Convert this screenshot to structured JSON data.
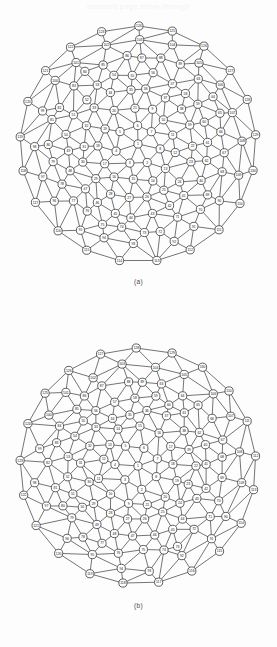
{
  "page": {
    "bleed_through_text": "scanned page show-through",
    "background_color": "#fdfdfd",
    "ink_color": "#2a2a2a"
  },
  "figures": [
    {
      "id": "fig-a",
      "caption": "(a)",
      "type": "planar-triangulation-disk",
      "node_count": 130,
      "description": "Triangulated disk graph with numbered circular vertices",
      "node_labels": [
        "1",
        "2",
        "3",
        "4",
        "5",
        "6",
        "7",
        "8",
        "9",
        "10",
        "11",
        "12",
        "13",
        "14",
        "15",
        "16",
        "17",
        "18",
        "19",
        "20",
        "21",
        "22",
        "23",
        "24",
        "25",
        "26",
        "27",
        "28",
        "29",
        "30",
        "31",
        "32",
        "33",
        "34",
        "35",
        "36",
        "37",
        "38",
        "39",
        "40",
        "41",
        "42",
        "43",
        "44",
        "45",
        "46",
        "47",
        "48",
        "49",
        "50",
        "51",
        "52",
        "53",
        "54",
        "55",
        "56",
        "57",
        "58",
        "59",
        "60",
        "61",
        "62",
        "63",
        "64",
        "65",
        "66",
        "67",
        "68",
        "69",
        "70",
        "71",
        "72",
        "73",
        "74",
        "75",
        "76",
        "77",
        "78",
        "79",
        "80",
        "81",
        "82",
        "83",
        "84",
        "85",
        "86",
        "87",
        "88",
        "89",
        "90",
        "91",
        "92",
        "93",
        "94",
        "95",
        "96",
        "97",
        "98",
        "99",
        "100",
        "101",
        "102",
        "103",
        "104",
        "105",
        "106",
        "107",
        "108",
        "109",
        "110",
        "111",
        "112",
        "113",
        "114",
        "115",
        "116",
        "117",
        "118",
        "119",
        "120",
        "121",
        "122",
        "123",
        "124",
        "125",
        "126",
        "127",
        "128",
        "129",
        "130"
      ]
    },
    {
      "id": "fig-b",
      "caption": "(b)",
      "type": "planar-triangulation-disk",
      "node_count": 130,
      "description": "Triangulated disk graph with numbered circular vertices, alternate labelling",
      "node_labels": [
        "1",
        "2",
        "3",
        "4",
        "5",
        "6",
        "7",
        "8",
        "9",
        "10",
        "11",
        "12",
        "13",
        "14",
        "15",
        "16",
        "17",
        "18",
        "19",
        "20",
        "21",
        "22",
        "23",
        "24",
        "25",
        "26",
        "27",
        "28",
        "29",
        "30",
        "31",
        "32",
        "33",
        "34",
        "35",
        "36",
        "37",
        "38",
        "39",
        "40",
        "41",
        "42",
        "43",
        "44",
        "45",
        "46",
        "47",
        "48",
        "49",
        "50",
        "51",
        "52",
        "53",
        "54",
        "55",
        "56",
        "57",
        "58",
        "59",
        "60",
        "61",
        "62",
        "63",
        "64",
        "65",
        "66",
        "67",
        "68",
        "69",
        "70",
        "71",
        "72",
        "73",
        "74",
        "75",
        "76",
        "77",
        "78",
        "79",
        "80",
        "81",
        "82",
        "83",
        "84",
        "85",
        "86",
        "87",
        "88",
        "89",
        "90",
        "91",
        "92",
        "93",
        "94",
        "95",
        "96",
        "97",
        "98",
        "99",
        "100",
        "101",
        "102",
        "103",
        "104",
        "105",
        "106",
        "107",
        "108",
        "109",
        "110",
        "111",
        "112",
        "113",
        "114",
        "115",
        "116",
        "117",
        "118",
        "119",
        "120",
        "121",
        "122",
        "123",
        "124",
        "125",
        "126",
        "127",
        "128",
        "129",
        "130"
      ]
    }
  ]
}
